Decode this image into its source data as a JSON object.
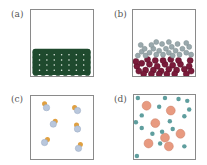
{
  "figure": {
    "panels": [
      {
        "id": "a",
        "label": "(a)",
        "description": "Closely packed ordered lattice of dark green particles filling bottom of container",
        "particle_color": "#1f4a2e",
        "highlight_color": "#e8efe8",
        "rows": 5,
        "cols": 8
      },
      {
        "id": "b",
        "label": "(b)",
        "description": "Two immiscible layers of clustered particles: grey-blue on top, crimson on bottom",
        "top_layer_color": "#9aa9ad",
        "bottom_layer_color": "#7a1a3a"
      },
      {
        "id": "c",
        "label": "(c)",
        "description": "Sparse diatomic molecules (light blue + orange atom pairs) spread throughout container",
        "atom_a_color": "#b9c7dc",
        "atom_b_color": "#e0a040",
        "molecule_count": 6
      },
      {
        "id": "d",
        "label": "(d)",
        "description": "Mixture of small teal particles and larger salmon particles spread throughout container",
        "small_color": "#5f9e9e",
        "large_color": "#e89a80",
        "small_count": 17,
        "large_count": 7
      }
    ]
  }
}
